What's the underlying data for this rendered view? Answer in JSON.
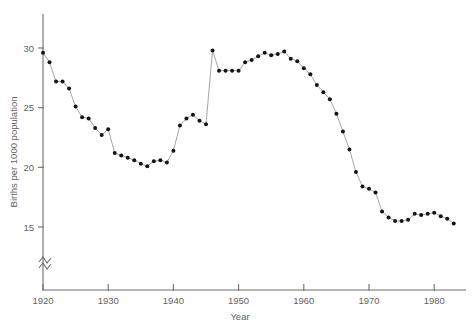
{
  "chart_data": {
    "type": "line",
    "title": "",
    "xlabel": "Year",
    "ylabel": "Births per 1000 population",
    "xlim": [
      1920,
      1985
    ],
    "ylim": [
      14.2,
      30.6
    ],
    "grid": false,
    "legend": null,
    "axis_break": {
      "axis": "y",
      "symbol": "zigzag",
      "note": "y-axis broken below 14"
    },
    "xticks": [
      1920,
      1930,
      1940,
      1950,
      1960,
      1970,
      1980
    ],
    "xticklabels": [
      "1920",
      "1930",
      "1940",
      "1950",
      "1960",
      "1970",
      "1980"
    ],
    "yticks": [
      15,
      20,
      25,
      30
    ],
    "yticklabels": [
      "15",
      "20",
      "25",
      "30"
    ],
    "marker": "filled-circle",
    "x": [
      1920,
      1921,
      1922,
      1923,
      1924,
      1925,
      1926,
      1927,
      1928,
      1929,
      1930,
      1931,
      1932,
      1933,
      1934,
      1935,
      1936,
      1937,
      1938,
      1939,
      1940,
      1941,
      1942,
      1943,
      1944,
      1945,
      1946,
      1947,
      1948,
      1949,
      1950,
      1951,
      1952,
      1953,
      1954,
      1955,
      1956,
      1957,
      1958,
      1959,
      1960,
      1961,
      1962,
      1963,
      1964,
      1965,
      1966,
      1967,
      1968,
      1969,
      1970,
      1971,
      1972,
      1973,
      1974,
      1975,
      1976,
      1977,
      1978,
      1979,
      1980,
      1981,
      1982,
      1983
    ],
    "values": [
      29.6,
      28.8,
      27.2,
      27.2,
      26.6,
      25.1,
      24.2,
      24.1,
      23.3,
      22.7,
      23.2,
      21.2,
      21.0,
      20.8,
      20.6,
      20.3,
      20.1,
      20.5,
      20.6,
      20.4,
      21.4,
      23.5,
      24.1,
      24.4,
      23.9,
      23.6,
      29.8,
      28.1,
      28.1,
      28.1,
      28.1,
      28.8,
      29.0,
      29.3,
      29.6,
      29.4,
      29.5,
      29.7,
      29.1,
      28.9,
      28.3,
      27.8,
      26.9,
      26.3,
      25.7,
      24.5,
      23.0,
      21.5,
      19.6,
      18.4,
      18.2,
      17.9,
      16.3,
      15.8,
      15.5,
      15.5,
      15.6,
      16.1,
      16.0,
      16.1,
      16.2,
      15.9,
      15.7,
      15.3
    ]
  },
  "axes": {
    "y_label": "Births per 1000 population",
    "x_label": "Year"
  }
}
